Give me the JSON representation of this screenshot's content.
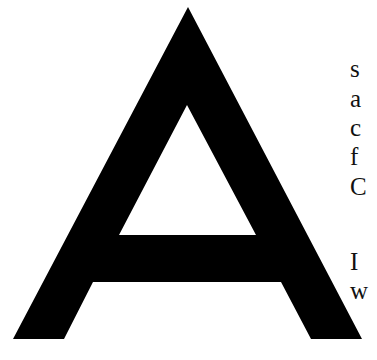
{
  "drop_cap": {
    "letter": "A",
    "color": "#000000"
  },
  "text_lines": [
    {
      "text": "s",
      "top": 56
    },
    {
      "text": "a",
      "top": 86
    },
    {
      "text": "c",
      "top": 115
    },
    {
      "text": "f",
      "top": 144
    },
    {
      "text": "C",
      "top": 174
    },
    {
      "text": "I",
      "top": 249
    },
    {
      "text": "w",
      "top": 278
    }
  ]
}
